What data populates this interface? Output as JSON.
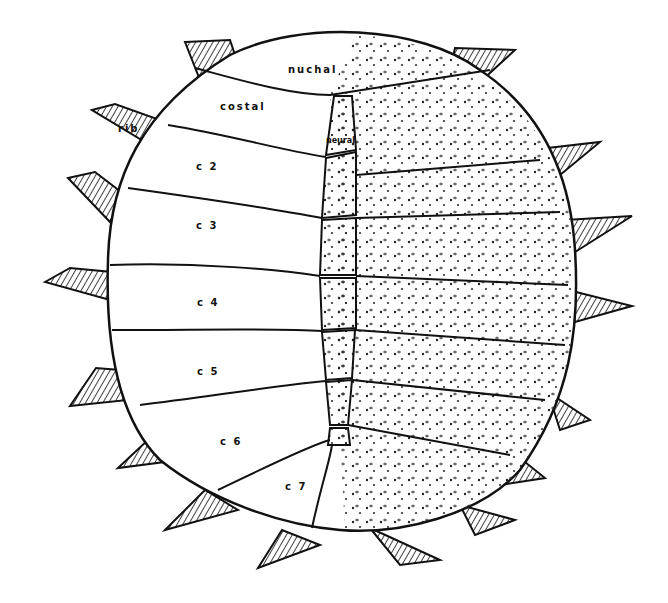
{
  "diagram": {
    "labels": {
      "nuchal": "nuchal",
      "costal": "costal",
      "neural": "neural",
      "rib": "rib",
      "c2": "c 2",
      "c3": "c 3",
      "c4": "c 4",
      "c5": "c 5",
      "c6": "c 6",
      "c7": "c 7"
    },
    "colors": {
      "line": "#111111",
      "background": "#ffffff"
    }
  }
}
